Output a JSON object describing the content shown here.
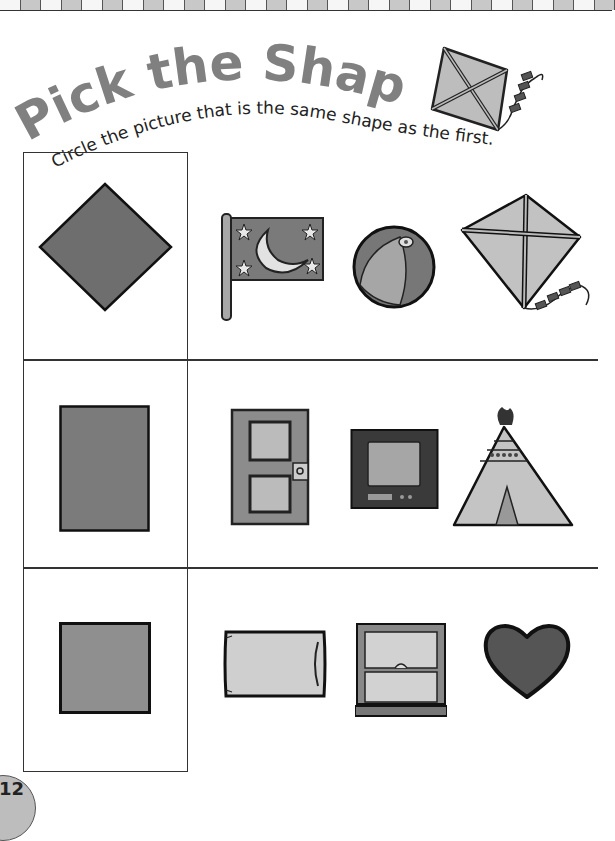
{
  "page": {
    "title": "Pick the Shape",
    "instruction": "Circle the picture that is the same shape as the first.",
    "page_number": "12",
    "title_color": "#808080",
    "text_color": "#222222"
  },
  "header_icon": "kite-icon",
  "rows": [
    {
      "target": {
        "shape": "diamond",
        "icon": "diamond-shape"
      },
      "choices": [
        {
          "label": "flag with moon and stars",
          "icon": "flag-icon"
        },
        {
          "label": "beach ball",
          "icon": "beach-ball-icon"
        },
        {
          "label": "kite",
          "icon": "kite-icon"
        }
      ]
    },
    {
      "target": {
        "shape": "rectangle",
        "icon": "rectangle-shape"
      },
      "choices": [
        {
          "label": "door",
          "icon": "door-icon"
        },
        {
          "label": "television",
          "icon": "tv-icon"
        },
        {
          "label": "teepee",
          "icon": "teepee-icon"
        }
      ]
    },
    {
      "target": {
        "shape": "square",
        "icon": "square-shape"
      },
      "choices": [
        {
          "label": "pillow",
          "icon": "pillow-icon"
        },
        {
          "label": "window",
          "icon": "window-icon"
        },
        {
          "label": "heart",
          "icon": "heart-icon"
        }
      ]
    }
  ]
}
